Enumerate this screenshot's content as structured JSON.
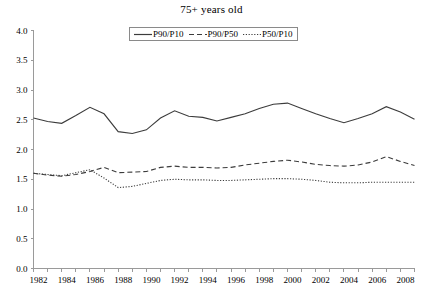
{
  "chart_data": {
    "type": "line",
    "title": "75+ years old",
    "xlabel": "",
    "ylabel": "",
    "xlim": [
      1982,
      2009
    ],
    "ylim": [
      0.0,
      4.0
    ],
    "grid": false,
    "legend_position": "top-center",
    "y_ticks": [
      "0.0",
      "0.5",
      "1.0",
      "1.5",
      "2.0",
      "2.5",
      "3.0",
      "3.5",
      "4.0"
    ],
    "y_tick_values": [
      0.0,
      0.5,
      1.0,
      1.5,
      2.0,
      2.5,
      3.0,
      3.5,
      4.0
    ],
    "x_tick_labels": [
      "1982",
      "1984",
      "1986",
      "1988",
      "1990",
      "1992",
      "1994",
      "1996",
      "1998",
      "2000",
      "2002",
      "2004",
      "2006",
      "2008"
    ],
    "x_tick_values": [
      1982,
      1984,
      1986,
      1988,
      1990,
      1992,
      1994,
      1996,
      1998,
      2000,
      2002,
      2004,
      2006,
      2008
    ],
    "x": [
      1982,
      1983,
      1984,
      1985,
      1986,
      1987,
      1988,
      1989,
      1990,
      1991,
      1992,
      1993,
      1994,
      1995,
      1996,
      1997,
      1998,
      1999,
      2000,
      2001,
      2002,
      2003,
      2004,
      2005,
      2006,
      2007,
      2008,
      2009
    ],
    "series": [
      {
        "name": "P90/P10",
        "style": "solid",
        "color": "#3c3c3c",
        "values": [
          2.53,
          2.47,
          2.44,
          2.57,
          2.71,
          2.6,
          2.3,
          2.27,
          2.33,
          2.53,
          2.65,
          2.56,
          2.54,
          2.48,
          2.54,
          2.6,
          2.69,
          2.76,
          2.78,
          2.69,
          2.6,
          2.52,
          2.45,
          2.52,
          2.6,
          2.72,
          2.63,
          2.51
        ]
      },
      {
        "name": "P90/P50",
        "style": "dashed",
        "color": "#3c3c3c",
        "values": [
          1.6,
          1.57,
          1.55,
          1.58,
          1.63,
          1.7,
          1.61,
          1.62,
          1.63,
          1.7,
          1.72,
          1.7,
          1.7,
          1.69,
          1.7,
          1.74,
          1.77,
          1.8,
          1.82,
          1.79,
          1.75,
          1.73,
          1.72,
          1.74,
          1.79,
          1.88,
          1.8,
          1.73
        ]
      },
      {
        "name": "P50/P10",
        "style": "dotted",
        "color": "#3c3c3c",
        "values": [
          1.6,
          1.58,
          1.56,
          1.61,
          1.66,
          1.52,
          1.36,
          1.38,
          1.43,
          1.48,
          1.5,
          1.49,
          1.49,
          1.48,
          1.48,
          1.49,
          1.5,
          1.51,
          1.51,
          1.5,
          1.48,
          1.45,
          1.44,
          1.44,
          1.45,
          1.45,
          1.45,
          1.45
        ]
      }
    ]
  },
  "legend": {
    "items": [
      {
        "label": "P90/P10",
        "style": "solid"
      },
      {
        "label": "P90/P50",
        "style": "dashed"
      },
      {
        "label": "P50/P10",
        "style": "dotted"
      }
    ]
  }
}
